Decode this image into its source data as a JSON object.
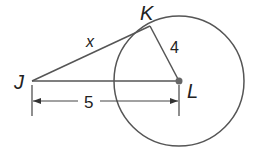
{
  "diagram": {
    "type": "geometry-tangent-circle",
    "colors": {
      "stroke": "#555555",
      "text": "#222222",
      "background": "#ffffff"
    },
    "points": {
      "J": {
        "label": "J",
        "x": 32,
        "y": 81
      },
      "K": {
        "label": "K",
        "x": 150,
        "y": 26
      },
      "L": {
        "label": "L",
        "x": 179,
        "y": 81
      }
    },
    "circle": {
      "center": "L",
      "cx": 179,
      "cy": 81,
      "r": 65
    },
    "segments": {
      "JK": {
        "label": "x"
      },
      "KL": {
        "label": "4"
      },
      "JL": {
        "label": "5"
      }
    },
    "dimension": {
      "label": "5",
      "from": "J",
      "to": "L"
    }
  }
}
